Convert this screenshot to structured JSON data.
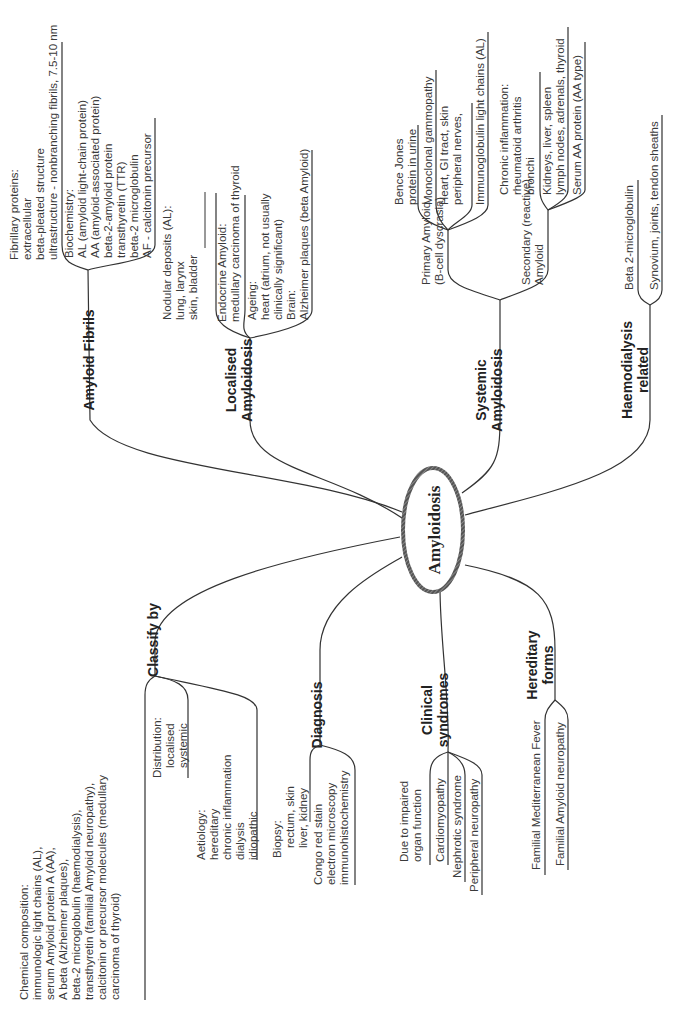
{
  "center": {
    "label": "Amyloidosis"
  },
  "branches": {
    "amyloid_fibrils": {
      "label": "Amyloid Fibrils",
      "fibrillary": [
        "Fibrillary proteins:",
        "extracellular",
        "beta-pleated structure",
        "ultrastructure - nonbranching fibrils,  7.5-10 nm"
      ],
      "biochemistry": [
        "Biochemistry:",
        "AL (amyloid light-chain protein)",
        "AA  (amyloid-associated protein)",
        "beta-2-amyloid protein",
        "transthyretin (TTR)",
        "beta-2 microglobulin",
        "AF - calcitonin precursor"
      ]
    },
    "localised": {
      "label_1": "Localised",
      "label_2": "Amyloidosis",
      "nodular": [
        "Nodular deposits (AL):",
        "lung, larynx",
        "skin, bladder"
      ],
      "endocrine": [
        "Endocrine Amyloid:",
        "medullary carcinoma of thyroid"
      ],
      "ageing": [
        "Ageing:",
        "heart (atrium, not usually",
        "clinically significant)",
        "Brain:",
        "Alzheimer plaques (beta Amyloid)"
      ]
    },
    "systemic": {
      "label_1": "Systemic",
      "label_2": "Amyloidosis",
      "primary": {
        "label": [
          "Primary Amyloid",
          "(B-cell dyscrasia)"
        ],
        "bence": [
          "Bence Jones",
          "protein in urine"
        ],
        "monoclonal": [
          "Monoclonal gammopathy"
        ],
        "heart": [
          "Heart, GI tract, skin",
          "peripheral nerves,"
        ],
        "immuno": [
          "Immunoglobulin light chains (AL)"
        ]
      },
      "secondary": {
        "label": [
          "Secondary (reactive)",
          "Amyloid"
        ],
        "chronic": [
          "Chronic inflammation:",
          "rheumatoid arthritis",
          "bronchi"
        ],
        "kidneys": [
          "Kidneys, liver, spleen",
          "lymph nodes, adrenals, thyroid"
        ],
        "serum": [
          "Serum AA protein (AA type)"
        ]
      }
    },
    "haemodialysis": {
      "label_1": "Haemodialysis",
      "label_2": "related",
      "beta2": [
        "Beta 2-microglobulin"
      ],
      "synovium": [
        "Synovium, joints, tendon sheaths"
      ]
    },
    "classify": {
      "label": "Classify by",
      "chemical": [
        "Chemical composition:",
        "immunologic light chains (AL),",
        "serum Amyloid protein A (AA),",
        "A beta (Alzheimer plaques),",
        "beta-2 microglobulin (haemodialysis),",
        "transthyretin (familial Amyloid neuropathy),",
        "calcitonin or precursor molecules (medullary",
        "carcinoma of thyroid)"
      ],
      "distribution": [
        "Distribution:",
        "localised",
        "systemic"
      ],
      "aetiology": [
        "Aetiology:",
        "hereditary",
        "chronic inflammation",
        "dialysis",
        "idiopathic"
      ]
    },
    "diagnosis": {
      "label": "Diagnosis",
      "biopsy": [
        "Biopsy:",
        "rectum, skin",
        "liver, kidney"
      ],
      "congo": [
        "Congo red stain",
        "electron microscopy",
        "immunohistochemistry"
      ]
    },
    "clinical": {
      "label_1": "Clinical",
      "label_2": "syndromes",
      "due": [
        "Due to impaired",
        "organ function"
      ],
      "cardio": [
        "Cardiomyopathy"
      ],
      "nephrotic": [
        "Nephrotic syndrome"
      ],
      "peripheral": [
        "Peripheral neuropathy"
      ]
    },
    "hereditary": {
      "label_1": "Hereditary",
      "label_2": "forms",
      "fmf": [
        "Familial Mediterranean Fever"
      ],
      "fan": [
        "Familial Amyloid neuropathy"
      ]
    }
  }
}
